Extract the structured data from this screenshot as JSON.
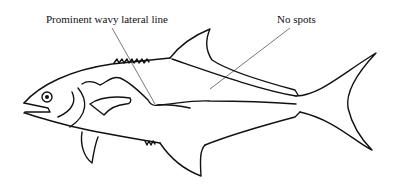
{
  "diagram": {
    "labels": [
      {
        "id": "lateral-line",
        "text": "Prominent wavy lateral line"
      },
      {
        "id": "spots",
        "text": "No spots"
      }
    ],
    "colors": {
      "stroke": "#111111",
      "leader": "#555555",
      "background": "#ffffff"
    }
  }
}
